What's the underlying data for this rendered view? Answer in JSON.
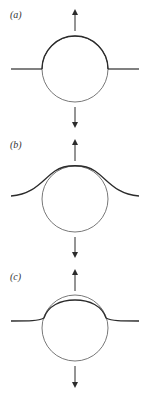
{
  "figure": {
    "colors": {
      "line": "#2b2b2b",
      "thin": "#555555",
      "background": "#ffffff"
    },
    "panels": [
      {
        "label": "(a)",
        "variant": "pinned-flat-interface"
      },
      {
        "label": "(b)",
        "variant": "deformed-bell-interface"
      },
      {
        "label": "(c)",
        "variant": "cap-detached-interface"
      }
    ],
    "arrows": {
      "up": "force-up",
      "down": "force-down"
    }
  }
}
